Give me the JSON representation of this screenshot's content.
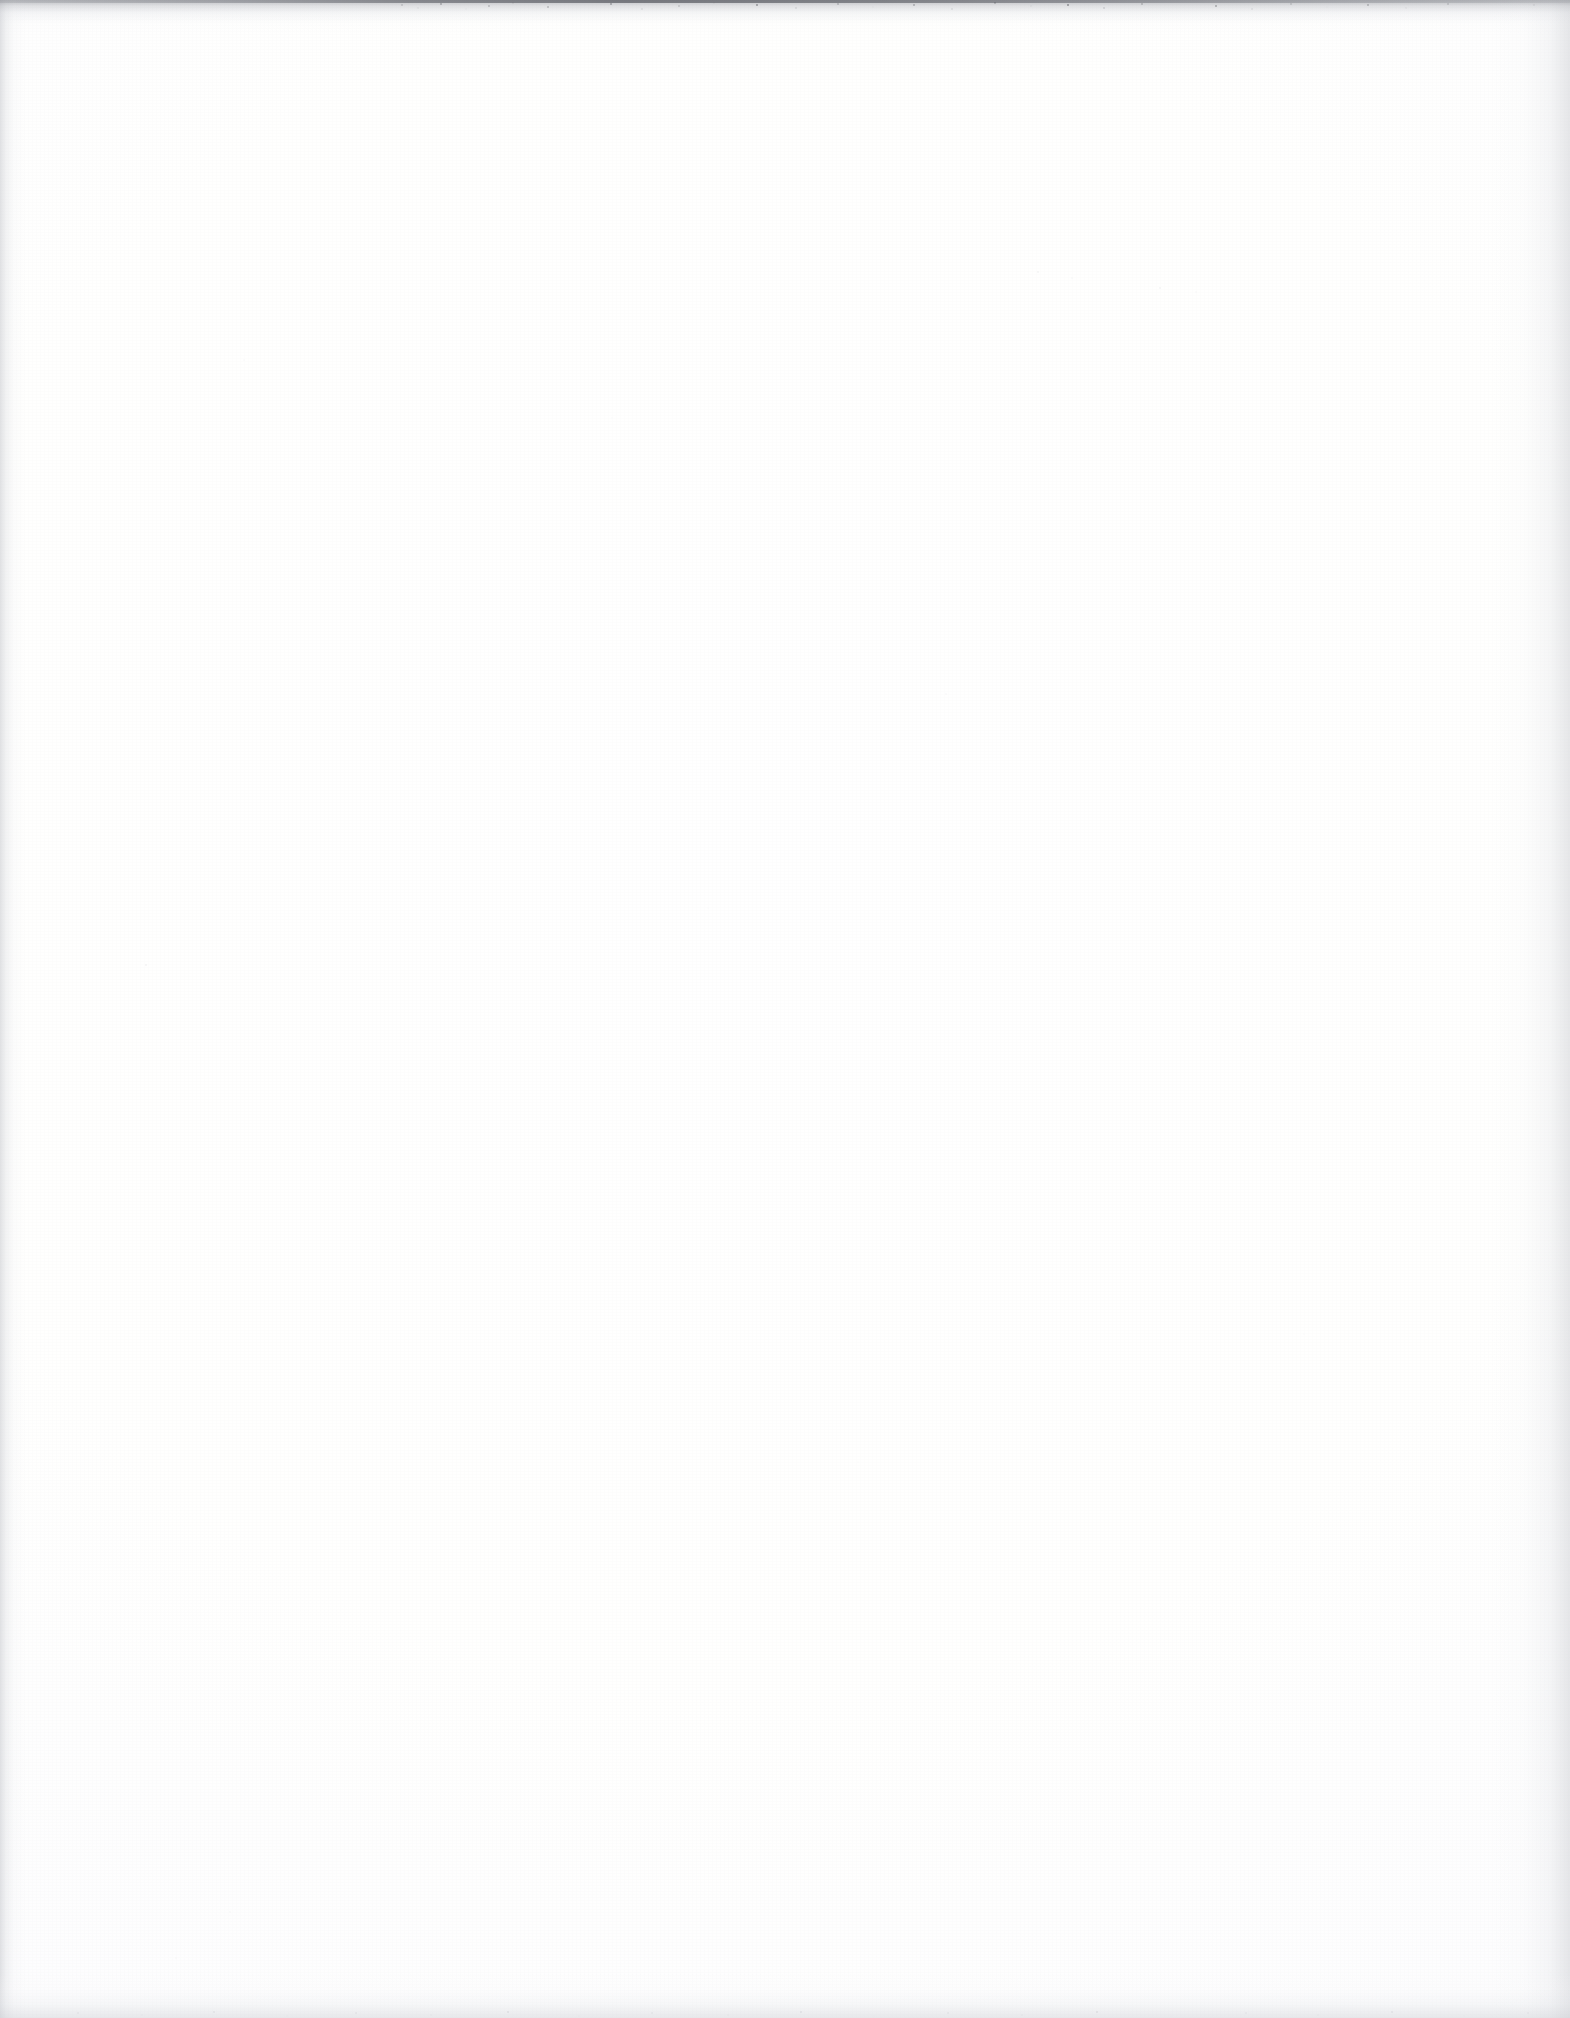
{
  "document": {
    "kind": "scanned-page",
    "description": "Blank scanned book page",
    "page_text": "",
    "width": 1570,
    "height": 2018
  },
  "colors": {
    "paper": "#fefeff",
    "paper_core": "#ffffff",
    "edge_shadow": "#c4c6cb",
    "top_boundary": "#56585f",
    "speckle": "#b0b2b8"
  },
  "artifacts": {
    "top_boundary": {
      "name": "top-scan-boundary",
      "label": "",
      "height_px": 22,
      "darkest_span_px": [
        400,
        1250
      ]
    },
    "left_edge": {
      "name": "left-edge-shadow",
      "label": "",
      "width_px": 26
    },
    "right_edge": {
      "name": "right-edge-shadow",
      "label": "",
      "width_px": 80
    },
    "bottom_edge": {
      "name": "bottom-edge-shadow",
      "label": "",
      "height_px": 46
    },
    "grain": {
      "name": "paper-grain",
      "label": ""
    },
    "noise": {
      "name": "scanner-noise-specks",
      "label": ""
    }
  }
}
